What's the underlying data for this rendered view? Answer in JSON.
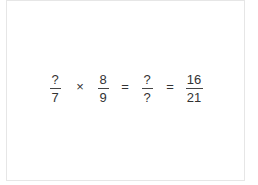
{
  "equation": {
    "fractions": [
      {
        "numerator": "?",
        "denominator": "7"
      },
      {
        "numerator": "8",
        "denominator": "9"
      },
      {
        "numerator": "?",
        "denominator": "?"
      },
      {
        "numerator": "16",
        "denominator": "21"
      }
    ],
    "operators": [
      "×",
      "=",
      "="
    ]
  },
  "colors": {
    "text": "#333333",
    "border": "#e6e6e6",
    "background": "#ffffff"
  }
}
